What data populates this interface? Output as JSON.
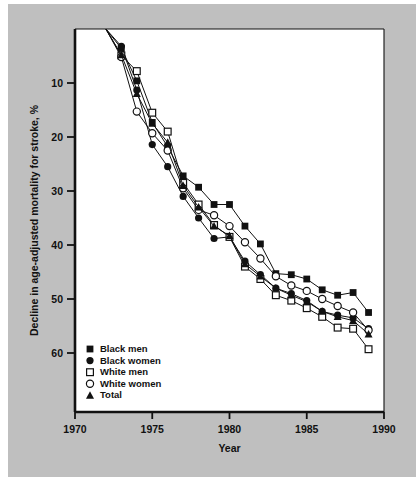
{
  "chart_data": {
    "type": "line",
    "title": "",
    "xlabel": "Year",
    "ylabel": "Decline in age-adjusted mortality for stroke, %",
    "xlim": [
      1970,
      1990
    ],
    "ylim": [
      0,
      65
    ],
    "y_inverted": true,
    "grid": false,
    "xticks": [
      1970,
      1975,
      1980,
      1985,
      1990
    ],
    "xtick_labels": [
      "1970",
      "1975",
      "1980",
      "1985",
      "1990"
    ],
    "yticks": [
      10,
      20,
      30,
      40,
      50,
      60
    ],
    "ytick_labels": [
      "10",
      "20",
      "30",
      "40",
      "50",
      "60"
    ],
    "legend_position": "lower-left",
    "x": [
      1972,
      1973,
      1974,
      1975,
      1976,
      1977,
      1978,
      1979,
      1980,
      1981,
      1982,
      1983,
      1984,
      1985,
      1986,
      1987,
      1988,
      1989
    ],
    "series": [
      {
        "name": "Black men",
        "marker": "filled-square",
        "values": [
          0.0,
          3.6,
          9.6,
          17.3,
          21.8,
          27.2,
          29.3,
          32.5,
          32.5,
          36.5,
          39.8,
          45.3,
          45.5,
          46.3,
          48.3,
          49.3,
          48.8,
          52.5
        ]
      },
      {
        "name": "Black women",
        "marker": "filled-circle",
        "values": [
          0.0,
          3.2,
          11.3,
          21.4,
          25.5,
          31.0,
          35.0,
          38.8,
          38.5,
          43.0,
          45.5,
          48.0,
          49.0,
          50.3,
          52.3,
          53.0,
          53.5,
          55.5
        ]
      },
      {
        "name": "White men",
        "marker": "open-square",
        "values": [
          0.0,
          4.9,
          7.8,
          15.5,
          19.0,
          28.5,
          32.5,
          36.3,
          38.5,
          44.0,
          46.3,
          49.3,
          50.3,
          51.7,
          53.3,
          55.3,
          55.5,
          59.3
        ]
      },
      {
        "name": "White women",
        "marker": "open-circle",
        "values": [
          0.0,
          5.2,
          15.3,
          19.3,
          22.5,
          29.5,
          33.5,
          34.5,
          36.5,
          39.5,
          42.5,
          45.8,
          47.5,
          48.5,
          50.0,
          51.3,
          52.5,
          55.8
        ]
      },
      {
        "name": "Total",
        "marker": "filled-triangle",
        "values": [
          0.0,
          4.8,
          12.0,
          17.5,
          21.0,
          29.0,
          33.0,
          36.5,
          38.3,
          43.5,
          45.8,
          48.0,
          49.3,
          50.5,
          52.3,
          53.3,
          54.0,
          56.5
        ]
      }
    ]
  },
  "colors": {
    "background": "#bfbfbf",
    "plot_background": "#ffffff",
    "ink": "#111111"
  }
}
